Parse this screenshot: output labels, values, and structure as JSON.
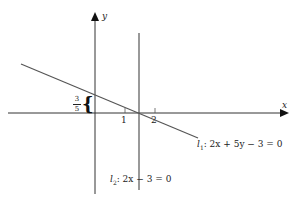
{
  "axes": {
    "x_label": "x",
    "y_label": "y",
    "ticks": [
      {
        "label": "1"
      },
      {
        "label": "2"
      }
    ]
  },
  "lines": {
    "l1": {
      "name": "l",
      "sub": "1",
      "equation": ": 2x + 5y − 3 = 0"
    },
    "l2": {
      "name": "l",
      "sub": "2",
      "equation": ": 2x − 3 = 0"
    }
  },
  "annotation": {
    "intercept_num": "3",
    "intercept_den": "5",
    "brace": "{"
  },
  "colors": {
    "axis": "#222222",
    "line": "#555555"
  }
}
